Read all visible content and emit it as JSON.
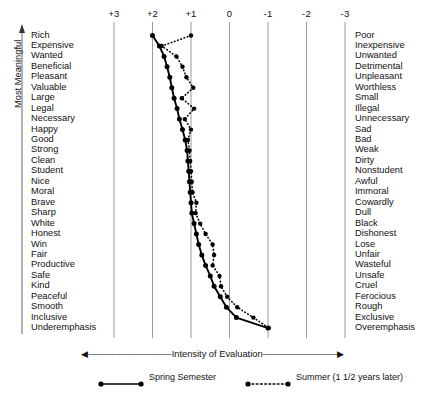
{
  "chart_data": {
    "type": "line",
    "title": "",
    "xlabel": "Intensity of Evaluation",
    "ylabel": "Most Meaningful",
    "xlim": [
      3,
      -3
    ],
    "xticks": [
      "+3",
      "+2",
      "+1",
      "0",
      "-1",
      "-2",
      "-3"
    ],
    "xtick_values": [
      3,
      2,
      1,
      0,
      -1,
      -2,
      -3
    ],
    "grid": true,
    "legend_position": "bottom",
    "categories_left": [
      "Rich",
      "Expensive",
      "Wanted",
      "Beneficial",
      "Pleasant",
      "Valuable",
      "Large",
      "Legal",
      "Necessary",
      "Happy",
      "Good",
      "Strong",
      "Clean",
      "Student",
      "Nice",
      "Moral",
      "Brave",
      "Sharp",
      "White",
      "Honest",
      "Win",
      "Fair",
      "Productive",
      "Safe",
      "Kind",
      "Peaceful",
      "Smooth",
      "Inclusive",
      "Underemphasis"
    ],
    "categories_right": [
      "Poor",
      "Inexpensive",
      "Unwanted",
      "Detrimental",
      "Unpleasant",
      "Worthless",
      "Small",
      "Illegal",
      "Unnecessary",
      "Sad",
      "Bad",
      "Weak",
      "Dirty",
      "Nonstudent",
      "Awful",
      "Immoral",
      "Cowardly",
      "Dull",
      "Black",
      "Dishonest",
      "Lose",
      "Unfair",
      "Wasteful",
      "Unsafe",
      "Cruel",
      "Ferocious",
      "Rough",
      "Exclusive",
      "Overemphasis"
    ],
    "series": [
      {
        "name": "Spring Semester",
        "style": "solid",
        "marker": "filled-circle",
        "values": [
          2.0,
          1.82,
          1.7,
          1.62,
          1.55,
          1.5,
          1.44,
          1.36,
          1.3,
          1.22,
          1.15,
          1.1,
          1.08,
          1.06,
          1.04,
          1.02,
          1.0,
          0.98,
          0.92,
          0.86,
          0.8,
          0.72,
          0.62,
          0.5,
          0.4,
          0.24,
          0.08,
          -0.18,
          -1.0
        ]
      },
      {
        "name": "Summer (1 1/2 years later)",
        "style": "dotted",
        "marker": "filled-circle",
        "values": [
          1.0,
          1.76,
          1.38,
          1.22,
          1.12,
          0.94,
          1.24,
          0.92,
          1.16,
          1.0,
          1.08,
          1.04,
          1.02,
          1.0,
          0.98,
          0.96,
          0.86,
          0.88,
          0.76,
          0.62,
          0.44,
          0.4,
          0.44,
          0.26,
          0.22,
          0.06,
          -0.2,
          -0.62,
          -1.02
        ]
      }
    ]
  },
  "legend": {
    "items": [
      {
        "label": "Spring Semester",
        "style": "solid"
      },
      {
        "label": "Summer (1 1/2 years later)",
        "style": "dotted"
      }
    ]
  }
}
